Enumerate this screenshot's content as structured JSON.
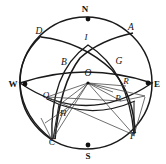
{
  "figure": {
    "type": "celestial-sphere-diagram",
    "width": 166,
    "height": 164,
    "stroke_color": "#1a1a1a",
    "thin_stroke_color": "#555555",
    "background": "#ffffff"
  },
  "cardinal_points": [
    {
      "id": "N",
      "label": "N",
      "x": 88,
      "y": 19,
      "label_x": 85,
      "label_y": 9
    },
    {
      "id": "S",
      "label": "S",
      "x": 88,
      "y": 145,
      "label_x": 88,
      "label_y": 156
    },
    {
      "id": "E",
      "label": "E",
      "x": 148,
      "y": 83,
      "label_x": 157,
      "label_y": 84
    },
    {
      "id": "W",
      "label": "W",
      "x": 25,
      "y": 84,
      "label_x": 13,
      "label_y": 84
    }
  ],
  "points": [
    {
      "id": "D",
      "label": "D",
      "label_x": 39,
      "label_y": 32
    },
    {
      "id": "A",
      "label": "A",
      "label_x": 131,
      "label_y": 28
    },
    {
      "id": "I",
      "label": "I",
      "label_x": 86,
      "label_y": 37
    },
    {
      "id": "B",
      "label": "B",
      "label_x": 64,
      "label_y": 63
    },
    {
      "id": "G",
      "label": "G",
      "label_x": 119,
      "label_y": 62
    },
    {
      "id": "O",
      "label": "O",
      "label_x": 88,
      "label_y": 74
    },
    {
      "id": "R",
      "label": "R",
      "label_x": 126,
      "label_y": 81
    },
    {
      "id": "Q",
      "label": "Q",
      "label_x": 46,
      "label_y": 95
    },
    {
      "id": "P",
      "label": "P",
      "label_x": 118,
      "label_y": 98
    },
    {
      "id": "H",
      "label": "H",
      "label_x": 63,
      "label_y": 113
    },
    {
      "id": "C",
      "label": "C",
      "label_x": 52,
      "label_y": 143
    },
    {
      "id": "F",
      "label": "F",
      "label_x": 133,
      "label_y": 137
    }
  ],
  "center": {
    "x": 88,
    "y": 83
  }
}
